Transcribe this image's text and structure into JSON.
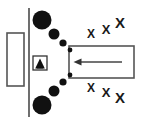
{
  "figure": {
    "background_color": "#ffffff",
    "stroke_color": "#555555",
    "fill_color": "#111111",
    "width": 148,
    "height": 125
  },
  "elements": {
    "left_panel": {
      "name": "left-panel-rectangle",
      "label": "",
      "x": 7,
      "y": 33,
      "width": 17,
      "height": 53,
      "stroke": "#555555",
      "fill": "#ffffff"
    },
    "barrier_line": {
      "name": "vertical-barrier-line",
      "label": "",
      "x": 29,
      "y1": 8,
      "y2": 117,
      "stroke": "#555555"
    },
    "sensor_icon": {
      "name": "sensor-triangle-icon",
      "label": "",
      "x": 33,
      "y": 56,
      "size": 14,
      "stroke": "#333333",
      "fill": "#ffffff",
      "glyph_fill": "#111111"
    },
    "flow_box": {
      "name": "flow-region-rectangle",
      "label": "",
      "x": 69,
      "y": 46,
      "width": 65,
      "height": 32,
      "stroke": "#555555",
      "fill": "#ffffff"
    },
    "flow_arrow": {
      "name": "flow-direction-arrow",
      "label": "",
      "direction": "left",
      "x_tail": 122,
      "x_head": 74,
      "y": 62,
      "stroke": "#444444"
    }
  },
  "particles": {
    "name": "particle-series",
    "label": "",
    "fill": "#111111",
    "upper_arc": [
      {
        "cx": 42,
        "cy": 20,
        "r": 9.5
      },
      {
        "cx": 54,
        "cy": 34,
        "r": 5.5
      },
      {
        "cx": 63,
        "cy": 43,
        "r": 3.6
      },
      {
        "cx": 70,
        "cy": 50,
        "r": 2.4
      }
    ],
    "lower_arc": [
      {
        "cx": 42,
        "cy": 105,
        "r": 9.5
      },
      {
        "cx": 54,
        "cy": 91,
        "r": 5.5
      },
      {
        "cx": 63,
        "cy": 82,
        "r": 3.6
      },
      {
        "cx": 70,
        "cy": 75,
        "r": 2.4
      }
    ]
  },
  "x_marks": {
    "name": "x-mark-series",
    "label": "X",
    "glyph": "X",
    "color": "#1a1a1a",
    "upper": [
      {
        "x": 91,
        "y": 38,
        "size": 12
      },
      {
        "x": 106,
        "y": 34,
        "size": 13
      },
      {
        "x": 120,
        "y": 28,
        "size": 15
      }
    ],
    "lower": [
      {
        "x": 91,
        "y": 92,
        "size": 12
      },
      {
        "x": 106,
        "y": 97,
        "size": 13
      },
      {
        "x": 120,
        "y": 103,
        "size": 15
      }
    ]
  }
}
